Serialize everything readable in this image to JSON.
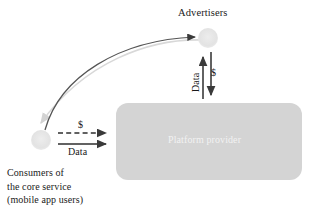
{
  "figure": {
    "type": "diagram",
    "background": "#ffffff"
  },
  "colors": {
    "node_fill": "#e2e2e2",
    "box_fill": "#d4d4d4",
    "box_text": "#f2f2f2",
    "arrow_dark": "#3a3a3a",
    "arrow_light": "#d8d8d8",
    "text": "#1a1a1a"
  },
  "nodes": [
    {
      "id": "advertisers",
      "label": "Advertisers",
      "shape": "circle",
      "fill": "#e2e2e2",
      "cx": 208,
      "cy": 38,
      "r": 10
    },
    {
      "id": "consumers",
      "label": "Consumers of",
      "label_line2": "the core service",
      "label_line3": "(mobile app users)",
      "shape": "circle",
      "fill": "#e2e2e2",
      "cx": 41,
      "cy": 140,
      "r": 10
    },
    {
      "id": "platform",
      "label": "Platform provider",
      "shape": "rounded-rect",
      "fill": "#d4d4d4",
      "x": 116,
      "y": 103,
      "width": 186,
      "height": 77,
      "radius": 12
    }
  ],
  "edges": [
    {
      "id": "consumer-to-platform-money",
      "label": "$",
      "style": "dashed",
      "direction": "right",
      "from": "consumers",
      "to": "platform"
    },
    {
      "id": "consumer-to-platform-data",
      "label": "Data",
      "style": "solid",
      "direction": "right",
      "from": "consumers",
      "to": "platform"
    },
    {
      "id": "platform-to-advertisers-data",
      "label": "Data",
      "style": "solid",
      "direction": "up",
      "from": "platform",
      "to": "advertisers"
    },
    {
      "id": "advertisers-to-platform-money",
      "label": "$",
      "style": "solid",
      "direction": "down",
      "from": "advertisers",
      "to": "platform"
    },
    {
      "id": "consumers-to-advertisers-curve",
      "label": "",
      "style": "curved-solid",
      "direction": "up-right",
      "from": "consumers",
      "to": "advertisers"
    },
    {
      "id": "advertisers-to-consumers-curve",
      "label": "",
      "style": "curved-light",
      "direction": "down-left",
      "from": "advertisers",
      "to": "consumers"
    }
  ],
  "labels": {
    "advertisers": "Advertisers",
    "platform_provider": "Platform provider",
    "consumers_line1": "Consumers of",
    "consumers_line2": "the core service",
    "consumers_line3": "(mobile app users)",
    "money_horizontal": "$",
    "data_horizontal": "Data",
    "money_vertical": "$",
    "data_vertical": "Data"
  }
}
